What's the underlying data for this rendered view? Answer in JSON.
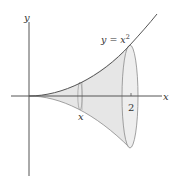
{
  "figure": {
    "type": "solid-of-revolution",
    "colors": {
      "axis": "#555555",
      "curve": "#555555",
      "solid_fill": "#e6e6e6",
      "solid_edge": "#8a8a8a",
      "rim_fill": "#eeeeee",
      "slice": "#9a9a9a",
      "background": "#ffffff"
    }
  },
  "labels": {
    "y_axis": "y",
    "x_axis": "x",
    "curve_lhs": "y = x",
    "curve_exp": "2",
    "slice_x": "x",
    "tick_2": "2"
  }
}
